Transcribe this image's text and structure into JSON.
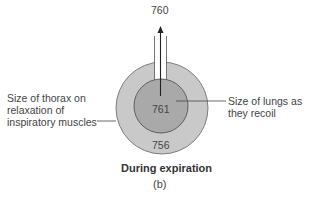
{
  "diagram": {
    "top_value": "760",
    "inner_value": "761",
    "outer_value": "756",
    "left_label": [
      "Size of thorax on",
      "relaxation of",
      "inspiratory muscles"
    ],
    "right_label": [
      "Size of lungs as",
      "they recoil"
    ],
    "caption": "During expiration",
    "panel": "(b)"
  },
  "colors": {
    "outer_ring": "#c9c9c9",
    "inner_disk": "#a9a9a9",
    "stroke": "#555555"
  }
}
